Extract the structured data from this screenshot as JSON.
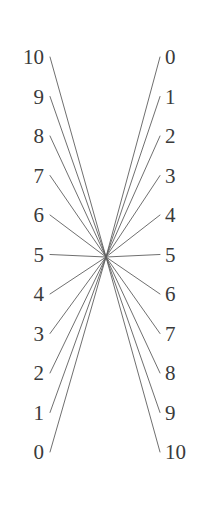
{
  "figure": {
    "width": 207,
    "height": 509,
    "background_color": "#ffffff",
    "line_color": "#5f5f5f",
    "label_color": "#3a3a3a"
  },
  "left_axis": {
    "name": "left-scale",
    "orientation": "vertical",
    "direction": "descending",
    "label_x": 44,
    "tick_x": 50,
    "top_y": 57,
    "bottom_y": 452,
    "labels": [
      "10",
      "9",
      "8",
      "7",
      "6",
      "5",
      "4",
      "3",
      "2",
      "1",
      "0"
    ]
  },
  "right_axis": {
    "name": "right-scale",
    "orientation": "vertical",
    "direction": "ascending",
    "label_x": 165,
    "tick_x": 160,
    "top_y": 57,
    "bottom_y": 452,
    "labels": [
      "0",
      "1",
      "2",
      "3",
      "4",
      "5",
      "6",
      "7",
      "8",
      "9",
      "10"
    ]
  },
  "convergence_point": {
    "name": "crossing-point",
    "x": 106,
    "y": 257
  },
  "chart_data": {
    "type": "line",
    "subtitle": "",
    "xlabel": "",
    "ylabel": "",
    "grid": false,
    "legend_position": "none",
    "left_scale_values": [
      10,
      9,
      8,
      7,
      6,
      5,
      4,
      3,
      2,
      1,
      0
    ],
    "right_scale_values": [
      0,
      1,
      2,
      3,
      4,
      5,
      6,
      7,
      8,
      9,
      10
    ],
    "left_scale_tick_labels": [
      "10",
      "9",
      "8",
      "7",
      "6",
      "5",
      "4",
      "3",
      "2",
      "1",
      "0"
    ],
    "right_scale_tick_labels": [
      "0",
      "1",
      "2",
      "3",
      "4",
      "5",
      "6",
      "7",
      "8",
      "9",
      "10"
    ],
    "left_ylim": [
      0,
      10
    ],
    "right_ylim": [
      0,
      10
    ],
    "series": [
      {
        "name": "connector-10-0",
        "left_value": 10,
        "right_value": 0
      },
      {
        "name": "connector-9-1",
        "left_value": 9,
        "right_value": 1
      },
      {
        "name": "connector-8-2",
        "left_value": 8,
        "right_value": 2
      },
      {
        "name": "connector-7-3",
        "left_value": 7,
        "right_value": 3
      },
      {
        "name": "connector-6-4",
        "left_value": 6,
        "right_value": 4
      },
      {
        "name": "connector-5-5",
        "left_value": 5,
        "right_value": 5
      },
      {
        "name": "connector-4-6",
        "left_value": 4,
        "right_value": 6
      },
      {
        "name": "connector-3-7",
        "left_value": 3,
        "right_value": 7
      },
      {
        "name": "connector-2-8",
        "left_value": 2,
        "right_value": 8
      },
      {
        "name": "connector-1-9",
        "left_value": 1,
        "right_value": 9
      },
      {
        "name": "connector-0-10",
        "left_value": 0,
        "right_value": 10
      }
    ]
  }
}
